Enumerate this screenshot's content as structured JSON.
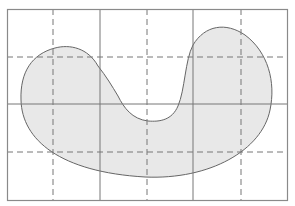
{
  "diagram": {
    "type": "grid-with-blob",
    "background": "#ffffff",
    "frame": {
      "x": 7,
      "y": 9,
      "width": 280,
      "height": 191,
      "stroke": "#8a8a8a"
    },
    "solid_grid": {
      "stroke": "#777777",
      "vertical_x": [
        100,
        193
      ],
      "horizontal_y": [
        104
      ]
    },
    "dashed_grid": {
      "stroke": "#777777",
      "dash": "6,4",
      "vertical_x": [
        53,
        147,
        241
      ],
      "horizontal_y": [
        57,
        152
      ]
    },
    "shape": {
      "name": "kidney-shape",
      "fill": "#e8e8e8",
      "stroke": "#666666",
      "path": "M 98 66 C 88 48, 70 44, 55 48 C 32 54, 20 72, 21 100 C 22 140, 60 172, 145 177 C 210 180, 262 150, 270 110 C 276 82, 268 52, 245 35 C 226 22, 205 25, 193 45 C 185 60, 185 90, 178 106 C 172 120, 160 122, 148 121 C 132 119, 124 108, 118 96 C 112 86, 106 76, 98 66 Z"
    }
  }
}
